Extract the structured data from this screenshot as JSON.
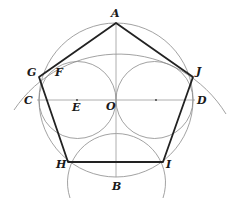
{
  "diagram": {
    "points": {
      "A": {
        "label": "A",
        "x": 116,
        "y": 23
      },
      "B": {
        "label": "B",
        "x": 116,
        "y": 177
      },
      "C": {
        "label": "C",
        "x": 39,
        "y": 100
      },
      "D": {
        "label": "D",
        "x": 193,
        "y": 100
      },
      "O": {
        "label": "O",
        "x": 116,
        "y": 100
      },
      "E": {
        "label": "E",
        "x": 77,
        "y": 100
      },
      "F": {
        "label": "F",
        "x": 52,
        "y": 70
      },
      "G": {
        "label": "G",
        "x": 39,
        "y": 77
      },
      "H": {
        "label": "H",
        "x": 68,
        "y": 162
      },
      "I": {
        "label": "I",
        "x": 163,
        "y": 162
      },
      "J": {
        "label": "J",
        "x": 193,
        "y": 77
      }
    },
    "pentagon": [
      "A",
      "J",
      "I",
      "H",
      "G"
    ],
    "colors": {
      "edge": "#222222",
      "construction": "#8a8a8a"
    }
  }
}
